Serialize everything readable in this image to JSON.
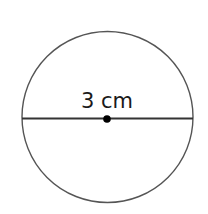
{
  "diagram": {
    "type": "circle-with-diameter",
    "label": "3 cm",
    "measurement": {
      "value": 3,
      "unit": "cm",
      "refers_to": "diameter"
    },
    "colors": {
      "stroke": "#555555",
      "line": "#333333",
      "center_dot": "#000000",
      "text": "#1a1a1a",
      "background": "#ffffff"
    }
  }
}
